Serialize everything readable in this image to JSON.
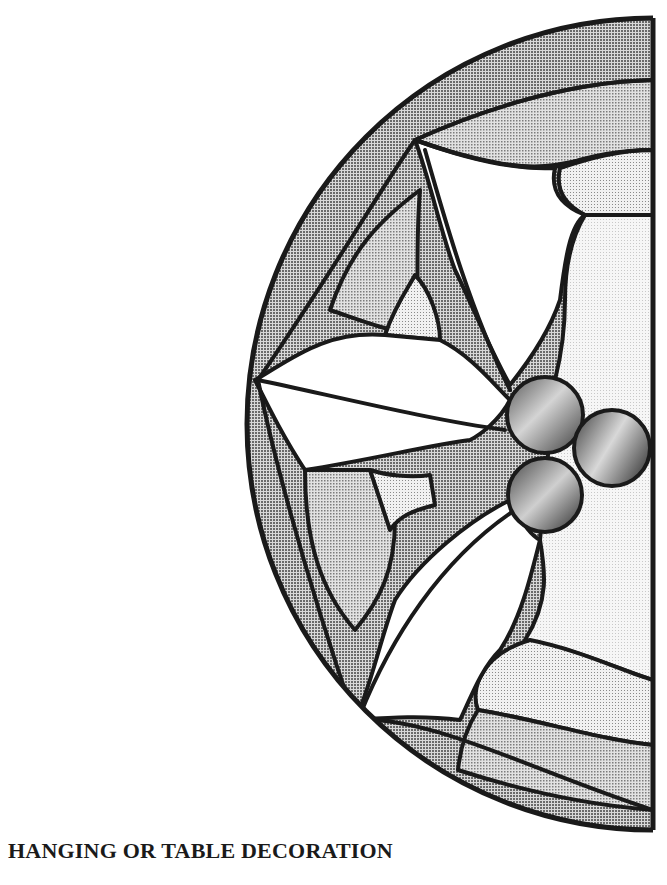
{
  "caption": "HANGING OR TABLE DECORATION",
  "figure": {
    "shape": "half-circle-stained-glass-pattern",
    "colors": {
      "lead_line": "#1a1a1a",
      "outer_band": "#9a9a9a",
      "middle_band": "#c4c4c4",
      "light_panel": "#dedede",
      "pale_panel": "#efefef",
      "leaf": "#ffffff",
      "berry_dark": "#3a3a3a",
      "berry_light": "#d0d0d0"
    },
    "berries": 3,
    "leaves": 3
  }
}
